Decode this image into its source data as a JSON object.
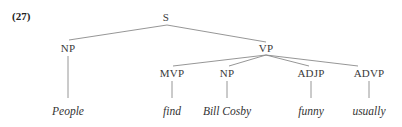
{
  "example_number": "(27)",
  "tree": {
    "root": "S",
    "nodes": {
      "S": "S",
      "NP_subj": "NP",
      "VP": "VP",
      "MVP": "MVP",
      "NP_obj": "NP",
      "ADJP": "ADJP",
      "ADVP": "ADVP"
    },
    "leaves": {
      "people": "People",
      "find": "find",
      "bill_cosby": "Bill Cosby",
      "funny": "funny",
      "usually": "usually"
    },
    "structure": [
      {
        "parent": "S",
        "children": [
          "NP",
          "VP"
        ]
      },
      {
        "parent": "NP",
        "children": [
          "People"
        ]
      },
      {
        "parent": "VP",
        "children": [
          "MVP",
          "NP",
          "ADJP",
          "ADVP"
        ]
      },
      {
        "parent": "MVP",
        "children": [
          "find"
        ]
      },
      {
        "parent": "NP",
        "children": [
          "Bill Cosby"
        ]
      },
      {
        "parent": "ADJP",
        "children": [
          "funny"
        ]
      },
      {
        "parent": "ADVP",
        "children": [
          "usually"
        ]
      }
    ]
  }
}
